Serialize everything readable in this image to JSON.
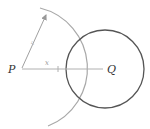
{
  "diagram": {
    "labels": {
      "point_p": "P",
      "point_q": "Q",
      "distance_x": "x",
      "radius_r": "r"
    },
    "colors": {
      "circle_stroke": "#555555",
      "arc_stroke": "#a8a8a8",
      "line_stroke": "#b0b0b0",
      "text": "#333333"
    },
    "geometry": {
      "p": [
        21,
        69
      ],
      "q": [
        105,
        69
      ],
      "circle_radius": 39,
      "arc_radius": 62
    }
  }
}
